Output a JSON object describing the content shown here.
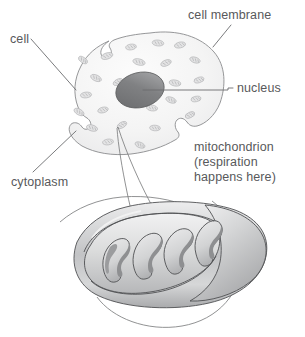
{
  "figure": {
    "background_color": "#ffffff",
    "text_color": "#58595b",
    "outline_color": "#7d7e80"
  },
  "labels": {
    "cell": "cell",
    "cell_membrane": "cell membrane",
    "nucleus": "nucleus",
    "cytoplasm": "cytoplasm",
    "mitochondrion_line1": "mitochondrion",
    "mitochondrion_line2": "(respiration",
    "mitochondrion_line3": "happens here)"
  },
  "parts": {
    "cell_body": "amoeboid-cell-outline",
    "nucleus_shape": "nucleus-ellipse",
    "magnifier_bubble": "magnification-circle",
    "zoom_funnel": "magnification-pointer",
    "mitochondrion": "cutaway-mitochondrion",
    "cristae_count": 5,
    "mini_mitochondria_count": 24
  },
  "colors": {
    "cytoplasm_fill": "#f4f4f4",
    "nucleus_dark": "#6e6f71",
    "nucleus_light": "#a9aaac",
    "mitochondrion_light": "#e9e9ea",
    "mitochondrion_mid": "#c9cacb",
    "mitochondrion_dark": "#8e8f91",
    "crista_shadow": "#8a8b8d",
    "mini_mitochondrion_fill": "#e3e3e4",
    "leader_line": "#6b6c6e"
  }
}
